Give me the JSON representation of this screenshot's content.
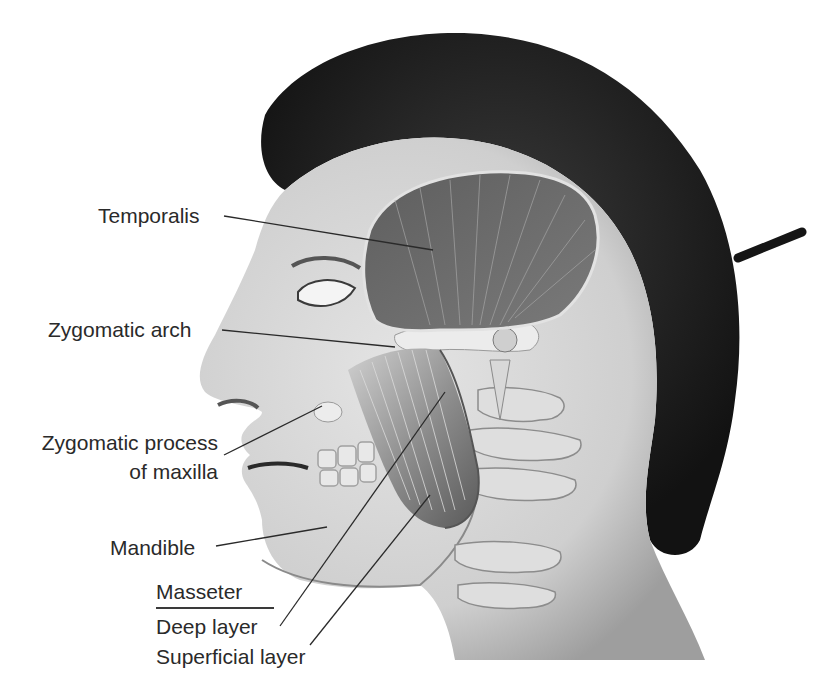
{
  "figure": {
    "palette": {
      "background": "#ffffff",
      "skin": "#d9d9d9",
      "skin_shadow": "#a8a8a8",
      "hair": "#1c1c1c",
      "muscle": "#6e6e6e",
      "muscle_fiber": "#bdbdbd",
      "bone": "#e6e6e6",
      "leader_line": "#2a2a2a",
      "label_text": "#2a2a2a"
    }
  },
  "labels": {
    "temporalis": "Temporalis",
    "zygomatic_arch": "Zygomatic arch",
    "zygomatic_process_line1": "Zygomatic process",
    "zygomatic_process_line2": "of maxilla",
    "mandible": "Mandible",
    "masseter_heading": "Masseter",
    "deep_layer": "Deep layer",
    "superficial_layer": "Superficial layer"
  }
}
